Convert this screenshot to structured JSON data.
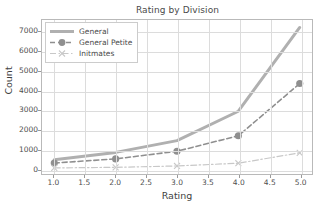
{
  "chart_data": {
    "type": "line",
    "title": "Rating by Division",
    "xlabel": "Rating",
    "ylabel": "Count",
    "x": [
      1,
      2,
      3,
      4,
      5
    ],
    "xlim": [
      0.8,
      5.2
    ],
    "ylim": [
      -250,
      7600
    ],
    "xticks": [
      "1.0",
      "1.5",
      "2.0",
      "2.5",
      "3.0",
      "3.5",
      "4.0",
      "4.5",
      "5.0"
    ],
    "xtick_values": [
      1.0,
      1.5,
      2.0,
      2.5,
      3.0,
      3.5,
      4.0,
      4.5,
      5.0
    ],
    "yticks": [
      "0",
      "1000",
      "2000",
      "3000",
      "4000",
      "5000",
      "6000",
      "7000"
    ],
    "ytick_values": [
      0,
      1000,
      2000,
      3000,
      4000,
      5000,
      6000,
      7000
    ],
    "grid": true,
    "legend_position": "upper left",
    "series": [
      {
        "name": "General",
        "values": [
          480,
          850,
          1450,
          2950,
          7220
        ],
        "color": "#b0b0b0",
        "linestyle": "solid",
        "marker": "none",
        "linewidth": 3
      },
      {
        "name": "General Petite",
        "values": [
          310,
          520,
          910,
          1700,
          4360
        ],
        "color": "#8f8f8f",
        "linestyle": "dashed",
        "marker": "circle",
        "linewidth": 1.6
      },
      {
        "name": "Initmates",
        "values": [
          60,
          90,
          160,
          300,
          830
        ],
        "color": "#c8c8c8",
        "linestyle": "dashdot",
        "marker": "x",
        "linewidth": 1.2
      }
    ]
  },
  "legend": {
    "items": [
      {
        "label": "General"
      },
      {
        "label": "General Petite"
      },
      {
        "label": "Initmates"
      }
    ]
  },
  "colors": {
    "axis": "#b9b9b9",
    "grid": "#dcdcdc",
    "text": "#4a4a4a",
    "background": "#ffffff"
  }
}
